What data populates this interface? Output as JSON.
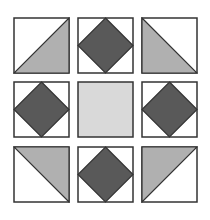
{
  "colors": {
    "background": "#ffffff",
    "border": "#333333",
    "dark_fill": "#595959",
    "light_fill": "#b0b0b0",
    "center_fill": "#d9d9d9"
  },
  "grid": {
    "rows": 3,
    "cols": 3,
    "tiles": [
      {
        "row": 0,
        "col": 0,
        "pattern": "half-triangle-bottom-right"
      },
      {
        "row": 0,
        "col": 1,
        "pattern": "diamond"
      },
      {
        "row": 0,
        "col": 2,
        "pattern": "half-triangle-bottom-left"
      },
      {
        "row": 1,
        "col": 0,
        "pattern": "diamond"
      },
      {
        "row": 1,
        "col": 1,
        "pattern": "solid"
      },
      {
        "row": 1,
        "col": 2,
        "pattern": "diamond"
      },
      {
        "row": 2,
        "col": 0,
        "pattern": "half-triangle-top-right"
      },
      {
        "row": 2,
        "col": 1,
        "pattern": "diamond"
      },
      {
        "row": 2,
        "col": 2,
        "pattern": "half-triangle-top-left"
      }
    ]
  }
}
